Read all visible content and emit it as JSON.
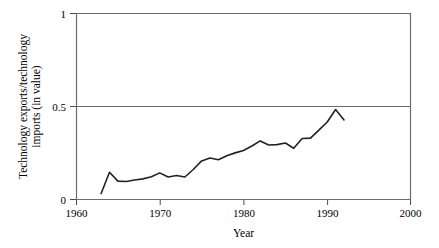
{
  "chart_data": {
    "type": "line",
    "title": "",
    "xlabel": "Year",
    "ylabel": "Technology exports/technology imports (in value)",
    "xlim": [
      1960,
      2000
    ],
    "ylim": [
      0,
      1
    ],
    "xticks": [
      1960,
      1970,
      1980,
      1990,
      2000
    ],
    "xtick_labels": [
      "1960",
      "1970",
      "1980",
      "1990",
      "2000"
    ],
    "yticks": [
      0,
      0.5,
      1
    ],
    "ytick_labels": [
      "0",
      "0.5",
      "1"
    ],
    "grid": "horizontal-only-at-0.5-and-1",
    "legend": "none",
    "line_color": "#222222",
    "series": [
      {
        "name": "Technology exports/technology imports (in value)",
        "x": [
          1963,
          1964,
          1965,
          1966,
          1967,
          1968,
          1969,
          1970,
          1971,
          1972,
          1973,
          1974,
          1975,
          1976,
          1977,
          1978,
          1979,
          1980,
          1981,
          1982,
          1983,
          1984,
          1985,
          1986,
          1987,
          1988,
          1989,
          1990,
          1991,
          1992
        ],
        "values": [
          0.035,
          0.148,
          0.101,
          0.099,
          0.107,
          0.113,
          0.124,
          0.145,
          0.123,
          0.131,
          0.123,
          0.163,
          0.209,
          0.225,
          0.215,
          0.237,
          0.252,
          0.265,
          0.289,
          0.316,
          0.294,
          0.296,
          0.305,
          0.277,
          0.329,
          0.331,
          0.374,
          0.417,
          0.484,
          0.428
        ]
      }
    ]
  },
  "axis": {
    "x_title": "Year",
    "y_title_line1": "Technology exports/technology",
    "y_title_line2": "imports (in value)"
  }
}
